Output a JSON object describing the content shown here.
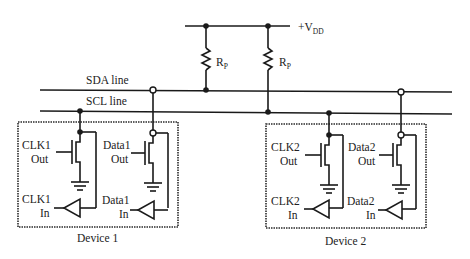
{
  "diagram": {
    "type": "I2C bus circuit",
    "supply": {
      "label": "+V",
      "subscript": "DD"
    },
    "pullups": [
      {
        "label": "R",
        "subscript": "P",
        "connects": "SDA line"
      },
      {
        "label": "R",
        "subscript": "P",
        "connects": "SCL line"
      }
    ],
    "lines": {
      "sda": "SDA line",
      "scl": "SCL line"
    },
    "devices": [
      {
        "name": "Device 1",
        "clk_out": [
          "CLK1",
          "Out"
        ],
        "clk_in": [
          "CLK1",
          "In"
        ],
        "data_out": [
          "Data1",
          "Out"
        ],
        "data_in": [
          "Data1",
          "In"
        ]
      },
      {
        "name": "Device 2",
        "clk_out": [
          "CLK2",
          "Out"
        ],
        "clk_in": [
          "CLK2",
          "In"
        ],
        "data_out": [
          "Data2",
          "Out"
        ],
        "data_in": [
          "Data2",
          "In"
        ]
      }
    ],
    "colors": {
      "line": "#1a1a1a",
      "background": "#ffffff"
    }
  }
}
